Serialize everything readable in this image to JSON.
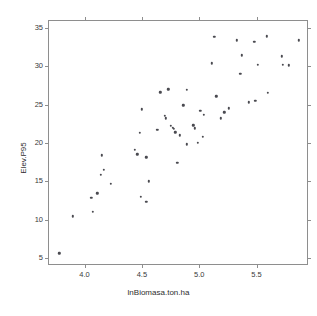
{
  "chart_data": {
    "type": "scatter",
    "title": "",
    "xlabel": "lnBiomasa.ton.ha",
    "ylabel": "Elev.P95",
    "xlim": [
      3.69,
      5.94
    ],
    "ylim": [
      4.2,
      35.9
    ],
    "xticks": [
      4.0,
      4.5,
      5.0,
      5.5
    ],
    "xtick_labels": [
      "4.0",
      "4.5",
      "5.0",
      "5.5"
    ],
    "yticks": [
      5,
      10,
      15,
      20,
      25,
      30,
      35
    ],
    "ytick_labels": [
      "5",
      "10",
      "15",
      "20",
      "25",
      "30",
      "35"
    ],
    "grid": false,
    "legend": null,
    "point_color": "#4a4a50",
    "axis_color": "#8e8e8e",
    "background": "#ffffff",
    "n_points": 62,
    "points": [
      {
        "x": 3.78,
        "y": 5.6
      },
      {
        "x": 3.9,
        "y": 10.4
      },
      {
        "x": 4.06,
        "y": 12.8
      },
      {
        "x": 4.07,
        "y": 11.0
      },
      {
        "x": 4.11,
        "y": 13.4
      },
      {
        "x": 4.14,
        "y": 15.8
      },
      {
        "x": 4.15,
        "y": 18.4
      },
      {
        "x": 4.17,
        "y": 16.5
      },
      {
        "x": 4.23,
        "y": 14.7
      },
      {
        "x": 4.44,
        "y": 19.1
      },
      {
        "x": 4.46,
        "y": 18.5
      },
      {
        "x": 4.48,
        "y": 21.3
      },
      {
        "x": 4.49,
        "y": 13.0
      },
      {
        "x": 4.5,
        "y": 24.4
      },
      {
        "x": 4.54,
        "y": 18.1
      },
      {
        "x": 4.54,
        "y": 12.3
      },
      {
        "x": 4.56,
        "y": 15.0
      },
      {
        "x": 4.63,
        "y": 21.7
      },
      {
        "x": 4.64,
        "y": 21.7
      },
      {
        "x": 4.66,
        "y": 26.6
      },
      {
        "x": 4.7,
        "y": 23.5
      },
      {
        "x": 4.71,
        "y": 23.2
      },
      {
        "x": 4.73,
        "y": 27.0
      },
      {
        "x": 4.75,
        "y": 22.2
      },
      {
        "x": 4.77,
        "y": 22.0
      },
      {
        "x": 4.78,
        "y": 21.8
      },
      {
        "x": 4.79,
        "y": 21.4
      },
      {
        "x": 4.81,
        "y": 17.4
      },
      {
        "x": 4.83,
        "y": 21.0
      },
      {
        "x": 4.86,
        "y": 24.9
      },
      {
        "x": 4.89,
        "y": 26.9
      },
      {
        "x": 4.89,
        "y": 19.8
      },
      {
        "x": 4.95,
        "y": 22.3
      },
      {
        "x": 4.96,
        "y": 21.9
      },
      {
        "x": 4.99,
        "y": 20.0
      },
      {
        "x": 5.01,
        "y": 24.2
      },
      {
        "x": 5.03,
        "y": 20.8
      },
      {
        "x": 5.04,
        "y": 23.7
      },
      {
        "x": 5.11,
        "y": 30.4
      },
      {
        "x": 5.13,
        "y": 33.8
      },
      {
        "x": 5.15,
        "y": 26.1
      },
      {
        "x": 5.19,
        "y": 23.2
      },
      {
        "x": 5.22,
        "y": 24.0
      },
      {
        "x": 5.26,
        "y": 24.5
      },
      {
        "x": 5.33,
        "y": 33.4
      },
      {
        "x": 5.36,
        "y": 29.0
      },
      {
        "x": 5.37,
        "y": 31.4
      },
      {
        "x": 5.43,
        "y": 25.3
      },
      {
        "x": 5.48,
        "y": 33.2
      },
      {
        "x": 5.49,
        "y": 25.5
      },
      {
        "x": 5.51,
        "y": 30.2
      },
      {
        "x": 5.59,
        "y": 33.9
      },
      {
        "x": 5.6,
        "y": 26.5
      },
      {
        "x": 5.72,
        "y": 31.3
      },
      {
        "x": 5.73,
        "y": 30.2
      },
      {
        "x": 5.78,
        "y": 30.1
      },
      {
        "x": 5.87,
        "y": 33.4
      }
    ]
  }
}
